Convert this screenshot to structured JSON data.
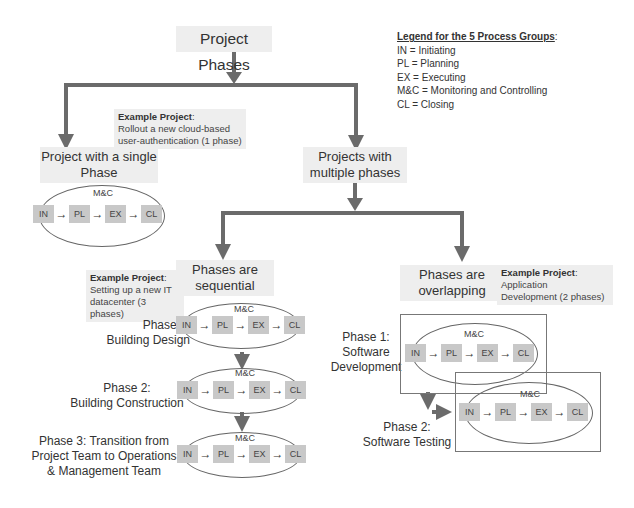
{
  "title": "Project Phases",
  "legend": {
    "heading": "Legend for the 5 Process Groups",
    "items": [
      "IN = Initiating",
      "PL = Planning",
      "EX = Executing",
      "M&C = Monitoring and Controlling",
      "CL = Closing"
    ]
  },
  "single": {
    "label_line1": "Project with a single",
    "label_line2": "Phase",
    "example_heading": "Example Project",
    "example_line1": "Rollout a new cloud-based",
    "example_line2": "user-authentication (1 phase)"
  },
  "multiple": {
    "label_line1": "Projects with",
    "label_line2": "multiple phases"
  },
  "sequential": {
    "label_line1": "Phases are",
    "label_line2": "sequential",
    "example_heading": "Example Project",
    "example_line1": "Setting up a new IT",
    "example_line2": "datacenter (3 phases)",
    "phases": [
      {
        "line1": "Phase 1:",
        "line2": "Building Design"
      },
      {
        "line1": "Phase 2:",
        "line2": "Building Construction"
      },
      {
        "line1": "Phase 3: Transition from",
        "line2": "Project Team  to Operations",
        "line3": "& Management Team"
      }
    ]
  },
  "overlapping": {
    "label_line1": "Phases are",
    "label_line2": "overlapping",
    "example_heading": "Example Project",
    "example_line1": "Application",
    "example_line2": "Development (2 phases)",
    "phases": [
      {
        "line1": "Phase 1:",
        "line2": "Software",
        "line3": "Development"
      },
      {
        "line1": "Phase 2:",
        "line2": "Software Testing"
      }
    ]
  },
  "process": {
    "mc": "M&C",
    "steps": [
      "IN",
      "PL",
      "EX",
      "CL"
    ],
    "arrow": "→"
  },
  "colors": {
    "connector": "#6b6b6b",
    "label_bg": "#eeeeee",
    "step_bg": "#c8c8c8"
  }
}
